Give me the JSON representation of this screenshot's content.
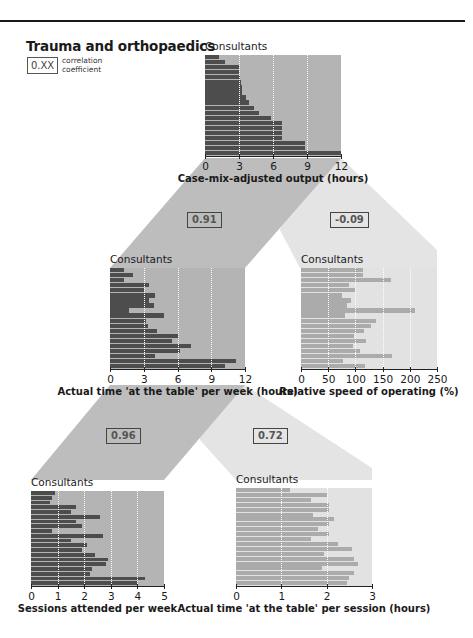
{
  "title": "Trauma and orthopaedics",
  "legend": {
    "box_text": "0.XX",
    "line1": "correlation",
    "line2": "coefficient"
  },
  "colors": {
    "dark_bar": "#4d4d4d",
    "dark_plot_bg": "#b4b4b4",
    "dark_band": "#bdbdbd",
    "light_bar": "#ababab",
    "light_plot_bg": "#e2e2e2",
    "light_band": "#e4e4e4"
  },
  "correlations": {
    "output_vs_time_per_week": "0.91",
    "output_vs_speed": "-0.09",
    "time_per_week_vs_sessions": "0.96",
    "time_per_week_vs_time_per_session": "0.72"
  },
  "chart_data": [
    {
      "id": "case_mix",
      "type": "bar",
      "orientation": "horizontal",
      "title": "Consultants",
      "xlabel": "Case-mix-adjusted output (hours)",
      "ylabel": "Consultants",
      "xlim": [
        0,
        12
      ],
      "ticks": [
        "0",
        "3",
        "6",
        "9",
        "12"
      ],
      "grid": true,
      "values": [
        1.2,
        1.8,
        3.0,
        3.0,
        3.1,
        3.2,
        3.3,
        3.3,
        3.6,
        3.9,
        4.3,
        4.8,
        5.8,
        6.8,
        6.8,
        6.8,
        6.8,
        8.8,
        8.8,
        12.0
      ]
    },
    {
      "id": "time_per_week",
      "type": "bar",
      "orientation": "horizontal",
      "title": "Consultants",
      "xlabel": "Actual time 'at the table' per week (hours)",
      "ylabel": "Consultants",
      "xlim": [
        0,
        12
      ],
      "ticks": [
        "0",
        "3",
        "6",
        "9",
        "12"
      ],
      "grid": true,
      "values": [
        1.2,
        2.0,
        1.2,
        3.5,
        3.0,
        4.0,
        3.5,
        3.9,
        1.7,
        4.8,
        3.2,
        3.4,
        4.2,
        6.0,
        5.5,
        7.2,
        6.2,
        4.0,
        11.2,
        10.2
      ]
    },
    {
      "id": "relative_speed",
      "type": "bar",
      "orientation": "horizontal",
      "title": "Consultants",
      "xlabel": "Relative speed of operating (%)",
      "ylabel": "Consultants",
      "xlim": [
        0,
        250
      ],
      "ticks": [
        "0",
        "50",
        "100",
        "150",
        "200",
        "250"
      ],
      "grid": true,
      "values": [
        113,
        113,
        165,
        88,
        100,
        75,
        92,
        85,
        210,
        80,
        137,
        128,
        115,
        97,
        120,
        95,
        108,
        167,
        78,
        118
      ]
    },
    {
      "id": "sessions",
      "type": "bar",
      "orientation": "horizontal",
      "title": "Consultants",
      "xlabel": "Sessions attended per week",
      "ylabel": "Consultants",
      "xlim": [
        0,
        5
      ],
      "ticks": [
        "0",
        "1",
        "2",
        "3",
        "4",
        "5"
      ],
      "grid": true,
      "values": [
        0.9,
        0.8,
        0.7,
        1.7,
        1.5,
        2.6,
        1.7,
        1.9,
        0.8,
        2.7,
        1.5,
        2.1,
        1.9,
        2.4,
        2.9,
        2.8,
        2.3,
        2.2,
        4.3,
        4.0
      ]
    },
    {
      "id": "time_per_session",
      "type": "bar",
      "orientation": "horizontal",
      "title": "Consultants",
      "xlabel": "Actual time 'at the table' per session (hours)",
      "ylabel": "Consultants",
      "xlim": [
        0,
        3
      ],
      "ticks": [
        "0",
        "1",
        "2",
        "3"
      ],
      "grid": true,
      "values": [
        1.2,
        2.0,
        1.65,
        2.05,
        2.05,
        1.7,
        2.15,
        2.05,
        1.8,
        2.05,
        1.65,
        2.25,
        2.55,
        1.95,
        2.6,
        2.7,
        1.9,
        2.6,
        2.5,
        2.45
      ]
    }
  ]
}
